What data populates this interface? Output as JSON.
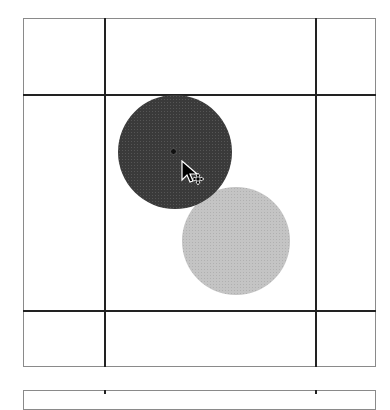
{
  "diagram": {
    "grid": {
      "outer": {
        "x": 23,
        "y": 18,
        "width": 353,
        "height": 349
      },
      "vertical_lines_x": [
        105,
        316
      ],
      "horizontal_lines_y": [
        95,
        311
      ]
    },
    "circles": [
      {
        "name": "dark-circle",
        "cx": 175,
        "cy": 152,
        "r": 57,
        "color": "#3a3a3a"
      },
      {
        "name": "light-circle",
        "cx": 236,
        "cy": 241,
        "r": 54,
        "color": "#c4c4c4"
      }
    ],
    "center_marker": {
      "x": 174,
      "y": 152
    },
    "cursor": {
      "type": "move-arrow",
      "x": 181,
      "y": 162
    },
    "partial_frame_below_y": 390
  }
}
